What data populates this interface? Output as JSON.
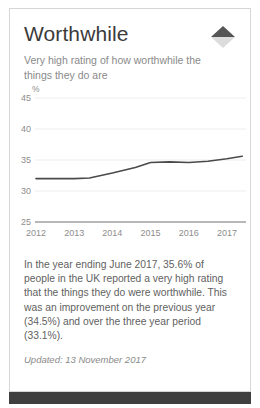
{
  "card": {
    "title": "Worthwhile",
    "subtitle": "Very high rating of how worthwhile the things they do are",
    "trend_icon": "trend-up-down-arrow-icon",
    "trend_direction": "up",
    "body_text": "In the year ending June 2017, 35.6% of people in the UK reported a very high rating that the things they do were worthwhile. This was an improvement on the previous year (34.5%) and over the three year period (33.1%).",
    "updated_label": "Updated: 13 November 2017"
  },
  "colors": {
    "line": "#4a4a4a",
    "axis": "#7a7a7a",
    "gridline": "#ededed",
    "title": "#3b3b3b",
    "muted_text": "#8a8a8a",
    "body_text": "#5f5f5f",
    "card_border": "#d6d6d6",
    "bottom_bar": "#3f3f3f",
    "arrow_up": "#555555",
    "arrow_down": "#d8d8d8"
  },
  "chart_data": {
    "type": "line",
    "title": "",
    "xlabel": "",
    "ylabel": "%",
    "ylim": [
      25,
      45
    ],
    "yticks": [
      25,
      30,
      35,
      40,
      45
    ],
    "ytick_labels": [
      "25",
      "30",
      "35",
      "40",
      "45"
    ],
    "xlim": [
      2012,
      2017.5
    ],
    "xticks": [
      2012,
      2013,
      2014,
      2015,
      2016,
      2017
    ],
    "xtick_labels": [
      "2012",
      "2013",
      "2014",
      "2015",
      "2016",
      "2017"
    ],
    "grid": true,
    "legend": "none",
    "series": [
      {
        "name": "Very high worthwhile rating",
        "x": [
          2012.0,
          2012.5,
          2013.0,
          2013.4,
          2014.0,
          2014.6,
          2015.0,
          2015.5,
          2016.0,
          2016.5,
          2017.0,
          2017.4
        ],
        "values": [
          32.0,
          32.0,
          32.0,
          32.1,
          32.9,
          33.8,
          34.6,
          34.7,
          34.6,
          34.8,
          35.2,
          35.6
        ]
      }
    ],
    "annotations": {
      "latest_value": 35.6,
      "previous_year_value": 34.5,
      "three_year_value": 33.1
    }
  }
}
